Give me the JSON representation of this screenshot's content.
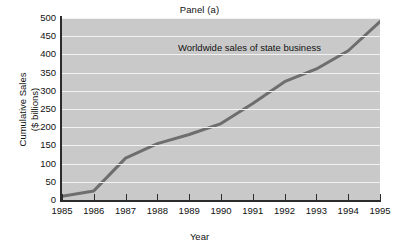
{
  "chart_data": {
    "type": "line",
    "title": "Panel (a)",
    "xlabel": "Year",
    "ylabel": "Cumulative Sales\n($ billions)",
    "ylabel_line1": "Cumulative Sales",
    "ylabel_line2": "($ billions)",
    "annotation": "Worldwide sales of state business",
    "grid": true,
    "legend_position": "none",
    "xlim": [
      1985,
      1995
    ],
    "ylim": [
      0,
      500
    ],
    "x": [
      1985,
      1986,
      1987,
      1988,
      1989,
      1990,
      1991,
      1992,
      1993,
      1994,
      1995
    ],
    "xticklabels": [
      "1985",
      "1986",
      "1987",
      "1988",
      "1989",
      "1990",
      "1991",
      "1992",
      "1993",
      "1994",
      "1995"
    ],
    "yticks": [
      0,
      50,
      100,
      150,
      200,
      250,
      300,
      350,
      400,
      450,
      500
    ],
    "yticklabels": [
      "0",
      "50",
      "100",
      "150",
      "200",
      "250",
      "300",
      "350",
      "400",
      "450",
      "500"
    ],
    "series": [
      {
        "name": "Worldwide sales of state business",
        "values": [
          10,
          25,
          115,
          155,
          180,
          210,
          265,
          325,
          360,
          410,
          490
        ],
        "color": "#6e6e6e",
        "line_width": 3
      }
    ],
    "colors": {
      "plot_background": "#c9c9c9",
      "gridline": "#f2f2f2",
      "axis": "#2b2b2b",
      "line": "#6e6e6e",
      "text": "#111111",
      "page_background": "#ffffff"
    }
  }
}
